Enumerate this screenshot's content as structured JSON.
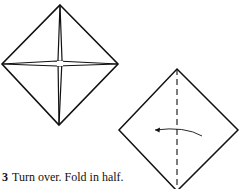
{
  "diagram": {
    "step": {
      "number": "3",
      "instruction": "Turn over. Fold in half."
    },
    "figures": [
      {
        "name": "preliminary-base-diamond",
        "description": "Square diamond with creased cross (4 flaps meeting at center)"
      },
      {
        "name": "folded-diamond-with-valley-fold",
        "description": "Diamond with vertical dashed fold line and curved arrow pointing left"
      }
    ],
    "colors": {
      "line": "#111111",
      "background": "#ffffff"
    }
  }
}
